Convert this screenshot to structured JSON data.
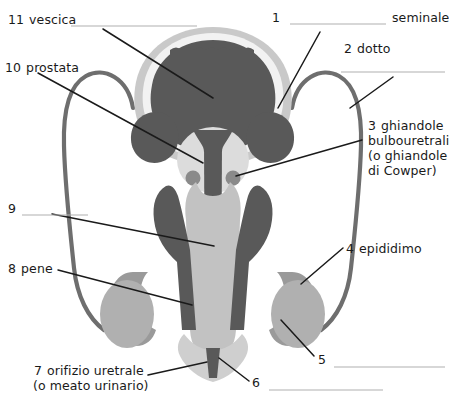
{
  "diagram": {
    "language": "it",
    "colors": {
      "background": "#ffffff",
      "organ_dark": "#595959",
      "organ_mid": "#8f8f8f",
      "organ_light": "#b5b5b5",
      "organ_pale": "#d9d9d9",
      "duct": "#6e6e6e",
      "leader_line": "#1a1a1a",
      "blank_rule": "#b0b0b0",
      "text": "#1a1a1a"
    },
    "labels": [
      {
        "id": "11",
        "number": "11",
        "text": "vescica",
        "blank": true,
        "x": 8,
        "y": 12
      },
      {
        "id": "10",
        "number": "10",
        "text": "prostata",
        "blank": false,
        "x": 5,
        "y": 60
      },
      {
        "id": "9",
        "number": "9",
        "text": "",
        "blank": true,
        "x": 8,
        "y": 201
      },
      {
        "id": "8",
        "number": "8",
        "text": "pene",
        "blank": false,
        "x": 8,
        "y": 261
      },
      {
        "id": "7",
        "number": "7",
        "text": "orifizio uretrale",
        "text2": "(o meato urinario)",
        "blank": false,
        "x": 34,
        "y": 363
      },
      {
        "id": "6",
        "number": "6",
        "text": "",
        "blank": true,
        "x": 252,
        "y": 375
      },
      {
        "id": "5",
        "number": "5",
        "text": "",
        "blank": true,
        "x": 318,
        "y": 352
      },
      {
        "id": "4",
        "number": "4",
        "text": "epididimo",
        "blank": false,
        "x": 346,
        "y": 241
      },
      {
        "id": "3",
        "number": "3",
        "text": "ghiandole",
        "text2": "bulbouretrali",
        "text3": "(o ghiandole",
        "text4": "di Cowper)",
        "blank": false,
        "x": 368,
        "y": 118
      },
      {
        "id": "2",
        "number": "2",
        "text": "dotto",
        "blank": true,
        "x": 344,
        "y": 41
      },
      {
        "id": "1",
        "number": "1",
        "text": "seminale",
        "blank": true,
        "x": 272,
        "y": 10
      }
    ],
    "parts": [
      {
        "key": "vescica",
        "label": "vescica",
        "number": "11"
      },
      {
        "key": "prostata",
        "label": "prostata",
        "number": "10"
      },
      {
        "key": "uretra",
        "label": "",
        "number": "9"
      },
      {
        "key": "pene",
        "label": "pene",
        "number": "8"
      },
      {
        "key": "orifizio",
        "label": "orifizio uretrale",
        "number": "7"
      },
      {
        "key": "glande",
        "label": "",
        "number": "6"
      },
      {
        "key": "testicolo",
        "label": "",
        "number": "5"
      },
      {
        "key": "epididimo",
        "label": "epididimo",
        "number": "4"
      },
      {
        "key": "bulbouretrali",
        "label": "ghiandole bulbouretrali (o ghiandole di Cowper)",
        "number": "3"
      },
      {
        "key": "dotto_deferente",
        "label": "dotto",
        "number": "2"
      },
      {
        "key": "vescichetta",
        "label": "seminale",
        "number": "1"
      }
    ]
  }
}
